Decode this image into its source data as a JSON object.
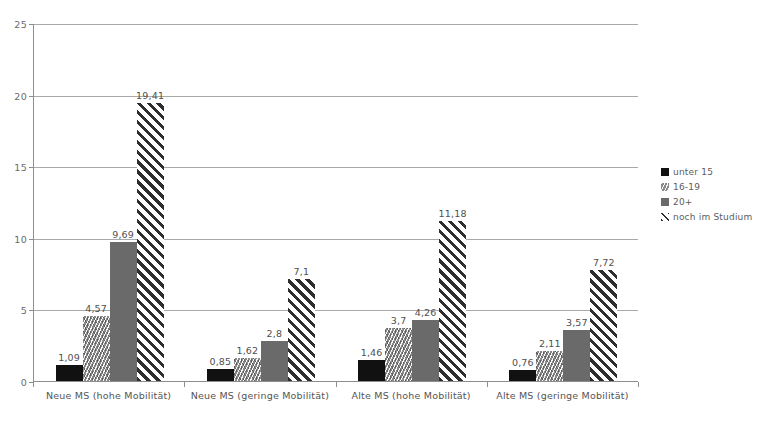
{
  "chart_data": {
    "type": "bar",
    "title": "",
    "subtitle": "",
    "xlabel": "",
    "ylabel": "",
    "ylim": [
      0,
      25
    ],
    "yticks": [
      0,
      5,
      10,
      15,
      20,
      25
    ],
    "grid": true,
    "legend_position": "right",
    "decimal_separator": ",",
    "categories": [
      "Neue MS (hohe Mobilität)",
      "Neue MS (geringe Mobilität)",
      "Alte MS (hohe Mobilität)",
      "Alte MS (geringe Mobilität)"
    ],
    "series": [
      {
        "name": "unter 15",
        "values": [
          1.09,
          0.85,
          1.46,
          0.76
        ],
        "labels": [
          "1,09",
          "0,85",
          "1,46",
          "0,76"
        ],
        "color": "#111111",
        "pattern": "solid-black"
      },
      {
        "name": "16-19",
        "values": [
          4.57,
          1.62,
          3.7,
          2.11
        ],
        "labels": [
          "4,57",
          "1,62",
          "3,7",
          "2,11"
        ],
        "color": "#8a8a8a",
        "pattern": "fine-hatch"
      },
      {
        "name": "20+",
        "values": [
          9.69,
          2.8,
          4.26,
          3.57
        ],
        "labels": [
          "9,69",
          "2,8",
          "4,26",
          "3,57"
        ],
        "color": "#6a6a6a",
        "pattern": "solid-gray"
      },
      {
        "name": "noch im Studium",
        "values": [
          19.41,
          7.1,
          11.18,
          7.72
        ],
        "labels": [
          "19,41",
          "7,1",
          "11,18",
          "7,72"
        ],
        "color": "#2e2e2e",
        "pattern": "diagonal-stripes"
      }
    ]
  },
  "legend": {
    "items": [
      {
        "label": "unter 15"
      },
      {
        "label": "16-19"
      },
      {
        "label": "20+"
      },
      {
        "label": "noch im Studium"
      }
    ]
  },
  "axis": {
    "y_tick_labels": [
      "25",
      "20",
      "15",
      "10",
      "5",
      "0"
    ]
  }
}
